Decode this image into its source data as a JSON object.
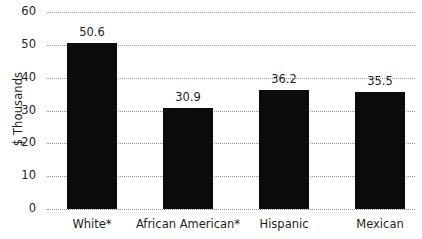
{
  "chart_data": {
    "type": "bar",
    "title": "",
    "xlabel": "",
    "ylabel": "$ Thousands",
    "categories": [
      "White*",
      "African American*",
      "Hispanic",
      "Mexican"
    ],
    "values": [
      50.6,
      30.9,
      36.2,
      35.5
    ],
    "value_labels": [
      "50.6",
      "30.9",
      "36.2",
      "35.5"
    ],
    "ylim": [
      0,
      60
    ],
    "yticks": [
      60,
      50,
      40,
      30,
      20,
      10,
      0
    ],
    "ytick_labels": [
      "60",
      "50",
      "40",
      "30",
      "20",
      "10",
      "0"
    ],
    "grid": "horizontal-dotted",
    "legend": "none",
    "bar_color": "#0c0c0c",
    "grid_color": "#9c9c9c",
    "text_color": "#231f20",
    "background_color": "#ffffff"
  }
}
